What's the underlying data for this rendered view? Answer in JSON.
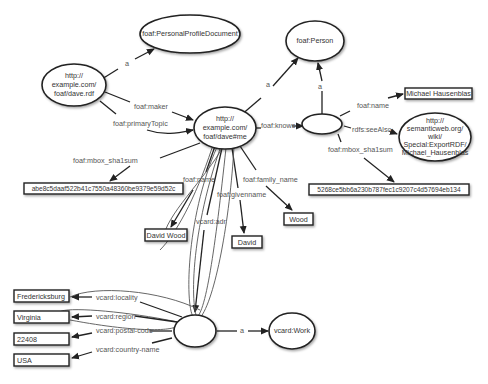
{
  "diagram": {
    "type": "RDF graph",
    "nodes": {
      "dave_rdf": {
        "lines": [
          "http://",
          "example.com/",
          "foaf/dave.rdf"
        ]
      },
      "ppd": {
        "label": "foaf:PersonalProfileDocument"
      },
      "me": {
        "lines": [
          "http://",
          "example.com/",
          "foaf/dave#me"
        ]
      },
      "person": {
        "label": "foaf:Person"
      },
      "blank_knows": {
        "label": ""
      },
      "michael_name": {
        "label": "Michael Hausenblas"
      },
      "seealso": {
        "lines": [
          "http://",
          "semanticweb.org/",
          "wiki/",
          "Special:ExportRDF/",
          "Michael_Hausenblas"
        ]
      },
      "sha_michael": {
        "label": "5268ce5bb6a230b787fec1c9207c4d57694eb134"
      },
      "sha_dave": {
        "label": "abe8c5daaf522b41c7550a48360be9379e59d52c"
      },
      "david_wood": {
        "label": "David Wood"
      },
      "david": {
        "label": "David"
      },
      "wood": {
        "label": "Wood"
      },
      "blank_adr": {
        "label": ""
      },
      "vcard_work": {
        "label": "vcard:Work"
      },
      "fredericksburg": {
        "label": "Fredericksburg"
      },
      "virginia": {
        "label": "Virginia"
      },
      "zip": {
        "label": "22408"
      },
      "usa": {
        "label": "USA"
      }
    },
    "edges": {
      "dave_a": "a",
      "maker": "foaf:maker",
      "primary_topic": "foaf:primaryTopic",
      "me_a": "a",
      "knows": "foaf:knows",
      "blank_a": "a",
      "m_name": "foaf:name",
      "see_also": "rdfs:seeAlso",
      "m_sha": "foaf:mbox_sha1sum",
      "d_sha": "foaf:mbox_sha1sum",
      "d_name": "foaf:name",
      "d_given": "foaf:givenname",
      "d_family": "foaf:family_name",
      "d_adr": "vcard:adr",
      "locality": "vcard:locality",
      "region": "vcard:region",
      "postal": "vcard:postal-code",
      "country": "vcard:country-name",
      "adr_a": "a"
    }
  }
}
